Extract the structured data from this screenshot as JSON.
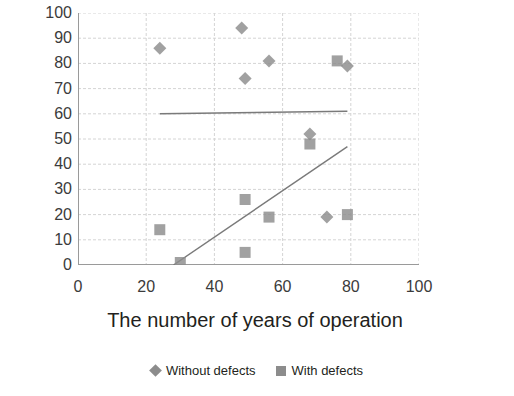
{
  "chart_data": {
    "type": "scatter",
    "title": "",
    "xlabel": "The number of years of operation",
    "ylabel": "100% structures",
    "xlim": [
      0,
      100
    ],
    "ylim": [
      0,
      100
    ],
    "xticks": [
      0,
      20,
      40,
      60,
      80,
      100
    ],
    "yticks": [
      0,
      10,
      20,
      30,
      40,
      50,
      60,
      70,
      80,
      90,
      100
    ],
    "grid": true,
    "legend_position": "bottom",
    "marker_color": "#8c8c8c",
    "trendline_color": "#7a7a7a",
    "series": [
      {
        "name": "Without defects",
        "marker": "diamond",
        "points": [
          {
            "x": 24,
            "y": 86
          },
          {
            "x": 48,
            "y": 94
          },
          {
            "x": 49,
            "y": 74
          },
          {
            "x": 56,
            "y": 81
          },
          {
            "x": 68,
            "y": 52
          },
          {
            "x": 73,
            "y": 19
          },
          {
            "x": 79,
            "y": 79
          }
        ],
        "trendline": {
          "x1": 24,
          "y1": 60,
          "x2": 79,
          "y2": 61
        }
      },
      {
        "name": "With defects",
        "marker": "square",
        "points": [
          {
            "x": 24,
            "y": 14
          },
          {
            "x": 30,
            "y": 1
          },
          {
            "x": 49,
            "y": 26
          },
          {
            "x": 49,
            "y": 5
          },
          {
            "x": 56,
            "y": 19
          },
          {
            "x": 68,
            "y": 48
          },
          {
            "x": 76,
            "y": 81
          },
          {
            "x": 79,
            "y": 20
          }
        ],
        "trendline": {
          "x1": 28,
          "y1": 0,
          "x2": 79,
          "y2": 47
        }
      }
    ]
  },
  "legend": {
    "items": [
      {
        "label": "Without defects",
        "marker": "diamond-marker-icon"
      },
      {
        "label": "With defects",
        "marker": "square-marker-icon"
      }
    ]
  },
  "axes": {
    "x_title": "The number of years of operation",
    "y_title": "100% structures",
    "x_tick_labels": [
      "0",
      "20",
      "40",
      "60",
      "80",
      "100"
    ],
    "y_tick_labels": [
      "100",
      "90",
      "80",
      "70",
      "60",
      "50",
      "40",
      "30",
      "20",
      "10",
      "0"
    ]
  }
}
